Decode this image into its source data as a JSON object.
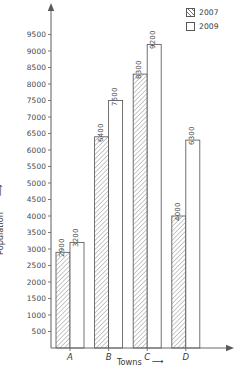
{
  "chart_data": {
    "type": "bar",
    "title": "",
    "subtitle": "",
    "xlabel": "Towns",
    "ylabel": "Population",
    "categories": [
      "A",
      "B",
      "C",
      "D"
    ],
    "series": [
      {
        "name": "2007",
        "values": [
          2900,
          6400,
          8300,
          4000
        ],
        "fill": "hatched"
      },
      {
        "name": "2009",
        "values": [
          3200,
          7500,
          9200,
          6300
        ],
        "fill": "white"
      }
    ],
    "ylim": [
      0,
      9800
    ],
    "ytick_step": 500,
    "yticks": [
      500,
      1000,
      1500,
      2000,
      2500,
      3000,
      3500,
      4000,
      4500,
      5000,
      5500,
      6000,
      6500,
      7000,
      7500,
      8000,
      8500,
      9000,
      9500
    ],
    "ytick_labels": [
      "500",
      "1000",
      "1500",
      "2000",
      "2500",
      "3000",
      "3500",
      "4000",
      "4500",
      "5000",
      "5500",
      "6000",
      "6500",
      "7000",
      "7500",
      "8000",
      "8500",
      "9000",
      "9500"
    ],
    "grid": false,
    "legend_position": "top-right",
    "axis_arrows": true,
    "axis_color": "#6b6b6b",
    "bar_edge_color": "#585858",
    "hatch_color": "#6e6e6e"
  },
  "axes": {
    "y_title": "Population",
    "y_arrow": "⟶",
    "x_title": "Towns",
    "x_arrow": "⟶"
  },
  "legend": {
    "entries": [
      {
        "label": "2007",
        "fill": "hatched"
      },
      {
        "label": "2009",
        "fill": "white"
      }
    ]
  }
}
